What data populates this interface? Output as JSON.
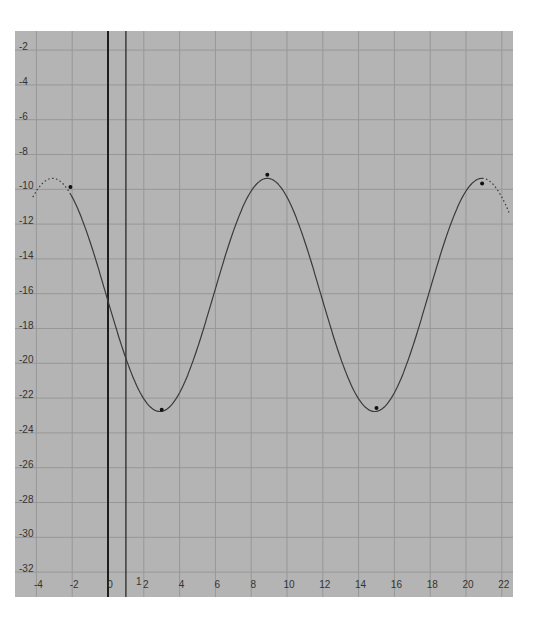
{
  "chart_data": {
    "type": "line",
    "title": "",
    "xlabel": "",
    "ylabel": "",
    "xlim": [
      -4.2,
      22.4
    ],
    "ylim": [
      -33.8,
      -1.2
    ],
    "grid": true,
    "legend": null,
    "x_ticks": [
      -4,
      -2,
      0,
      2,
      4,
      6,
      8,
      10,
      12,
      14,
      16,
      18,
      20,
      22
    ],
    "y_ticks": [
      -2,
      -4,
      -6,
      -8,
      -10,
      -12,
      -14,
      -16,
      -18,
      -20,
      -22,
      -24,
      -26,
      -28,
      -30,
      -32
    ],
    "x_tick_labels": [
      "-4",
      "-2",
      "0",
      "2",
      "4",
      "6",
      "8",
      "10",
      "12",
      "14",
      "16",
      "18",
      "20",
      "22"
    ],
    "y_tick_labels": [
      "-2",
      "-4",
      "-6",
      "-8",
      "-10",
      "-12",
      "-14",
      "-16",
      "-18",
      "-20",
      "-22",
      "-24",
      "-26",
      "-28",
      "-30",
      "-32"
    ],
    "vertical_markers": [
      {
        "x": 0,
        "style": "dark"
      },
      {
        "x": 1,
        "style": "thin",
        "label": "1"
      }
    ],
    "series": [
      {
        "name": "curve",
        "function": "sinusoid",
        "midline": -16.3,
        "amplitude": 6.7,
        "period": 12.0,
        "phase_peak_x": 8.9,
        "solid_range": [
          -2.1,
          20.9
        ],
        "dotted_ranges": [
          [
            -4.2,
            -2.1
          ],
          [
            20.9,
            22.4
          ]
        ],
        "key_points": [
          {
            "x": -2.1,
            "y": -10.1,
            "kind": "max"
          },
          {
            "x": 3.0,
            "y": -22.9,
            "kind": "min"
          },
          {
            "x": 8.9,
            "y": -9.4,
            "kind": "max"
          },
          {
            "x": 15.0,
            "y": -22.8,
            "kind": "min"
          },
          {
            "x": 20.9,
            "y": -9.9,
            "kind": "max"
          }
        ]
      }
    ],
    "colors": {
      "plot_background": "#b4b4b4",
      "grid": "#979797",
      "curve": "#3a3a3a",
      "axis_line": "#1e1e1e"
    }
  }
}
